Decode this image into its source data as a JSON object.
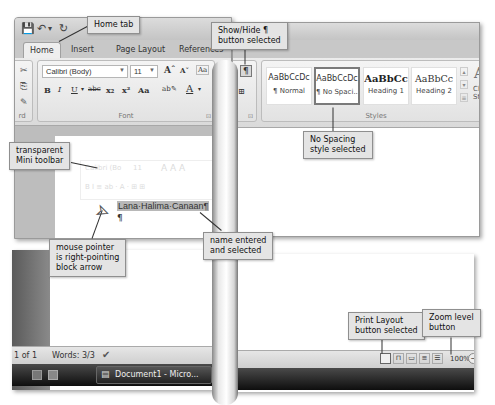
{
  "window": {
    "qat": {
      "save_icon": "💾",
      "undo_icon": "↶",
      "undo_dropdown": "▾",
      "redo_icon": "↻"
    },
    "tabs": [
      {
        "label": "Home",
        "active": true
      },
      {
        "label": "Insert",
        "active": false
      },
      {
        "label": "Page Layout",
        "active": false
      },
      {
        "label": "References",
        "active": false
      }
    ],
    "ribbon": {
      "clipboard_group": {
        "label": "rd",
        "launcher": "⊡"
      },
      "font_group": {
        "label": "Font",
        "font_name": "Calibri (Body)",
        "font_size": "11",
        "grow_font": "Aˆ",
        "shrink_font": "Aˇ",
        "clear_format": "Aa",
        "bold": "B",
        "italic": "I",
        "underline": "U",
        "strikethrough": "abc",
        "subscript": "x₂",
        "superscript": "x²",
        "change_case": "Aa",
        "highlight": "ab✎",
        "font_color": "A",
        "launcher": "⊡"
      },
      "paragraph_group": {
        "show_hide": "¶",
        "borders": "⊞",
        "launcher": "⊡"
      },
      "styles_group": {
        "label": "Styles",
        "items": [
          {
            "sample": "AaBbCcDc",
            "name": "¶ Normal",
            "selected": false
          },
          {
            "sample": "AaBbCcDc",
            "name": "¶ No Spaci...",
            "selected": true
          },
          {
            "sample": "AaBbCc",
            "name": "Heading 1",
            "selected": false
          },
          {
            "sample": "AaBbCc",
            "name": "Heading 2",
            "selected": false
          }
        ],
        "change_styles": "Change Styles"
      }
    },
    "document": {
      "mini_toolbar": {
        "font_name": "Calibri (Bo",
        "font_size": "11",
        "row2": "B  I  ≡  ab  ·  A  ·  ⊞  ⊞"
      },
      "selected_text": "Lana·Halima·Canaan¶",
      "paragraph_mark": "¶"
    },
    "status_bar": {
      "page": "1 of 1",
      "words": "Words: 3/3",
      "proofing_icon": "✔",
      "view_buttons": [
        "Print Layout",
        "Full Screen Reading",
        "Web Layout",
        "Outline",
        "Draft"
      ],
      "zoom_level": "100%",
      "zoom_out": "−"
    },
    "taskbar": {
      "document_button": "Document1 - Micro..."
    }
  },
  "callouts": {
    "home_tab": "Home tab",
    "show_hide": "Show/Hide ¶ button selected",
    "show_hide_l1": "Show/Hide ¶",
    "show_hide_l2": "button selected",
    "mini_toolbar_l1": "transparent",
    "mini_toolbar_l2": "Mini toolbar",
    "no_spacing_l1": "No Spacing",
    "no_spacing_l2": "style selected",
    "mouse_l1": "mouse pointer",
    "mouse_l2": "is right-pointing",
    "mouse_l3": "block arrow",
    "name_l1": "name entered",
    "name_l2": "and selected",
    "print_layout_l1": "Print Layout",
    "print_layout_l2": "button selected",
    "zoom_l1": "Zoom level",
    "zoom_l2": "button"
  }
}
